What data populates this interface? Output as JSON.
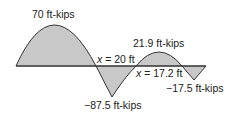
{
  "diagram": {
    "type": "bending-moment-diagram",
    "colors": {
      "fill": "#c8c8c8",
      "stroke": "#333333",
      "baseline": "#333333",
      "text": "#222222"
    },
    "labels": {
      "max_positive_1": "70 ft-kips",
      "max_positive_2": "21.9 ft-kips",
      "max_negative_1": "−87.5 ft-kips",
      "max_negative_2": "−17.5 ft-kips",
      "zero_crossing_1_var": "x",
      "zero_crossing_1_value": " = 20 ft",
      "zero_crossing_2_var": "x",
      "zero_crossing_2_value": " = 17.2 ft"
    },
    "values": {
      "peaks_ft_kips": [
        70,
        -87.5,
        21.9,
        -17.5
      ],
      "zero_crossings_ft": [
        20,
        17.2
      ]
    }
  }
}
